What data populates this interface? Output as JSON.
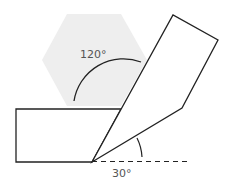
{
  "diagram": {
    "labels": {
      "angle_top": "120°",
      "angle_bottom": "30°"
    },
    "colors": {
      "stroke": "#222222",
      "hexagon_fill": "#eeeeee",
      "label": "#555555"
    }
  }
}
